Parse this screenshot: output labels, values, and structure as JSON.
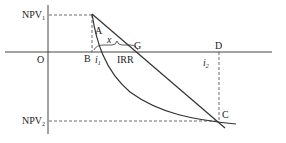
{
  "diagram": {
    "labels": {
      "npv1": "NPV",
      "npv1_sub": "1",
      "npv2": "NPV",
      "npv2_sub": "2",
      "origin": "O",
      "A": "A",
      "B": "B",
      "G": "G",
      "D": "D",
      "C": "C",
      "x": "x",
      "irr": "IRR",
      "i1": "i",
      "i1_sub": "1",
      "i2": "i",
      "i2_sub": "2"
    },
    "colors": {
      "line": "#333333",
      "text": "#222222"
    }
  }
}
